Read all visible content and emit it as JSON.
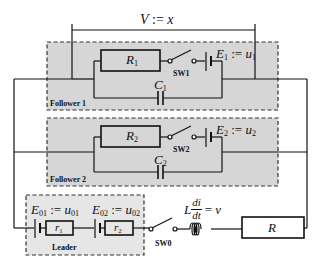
{
  "diagram": {
    "title_measure": {
      "label": "V := x",
      "lhs": "V",
      "op": ":=",
      "rhs": "x"
    },
    "groups": [
      {
        "name": "Follower 1",
        "components": {
          "resistor": {
            "symbol": "R",
            "sub": "1"
          },
          "switch": {
            "label": "SW1"
          },
          "source": {
            "symbol": "E",
            "sub": "1",
            "op": ":=",
            "rhs": "u",
            "rhs_sub": "1"
          },
          "capacitor": {
            "symbol": "C",
            "sub": "1"
          }
        }
      },
      {
        "name": "Follower 2",
        "components": {
          "resistor": {
            "symbol": "R",
            "sub": "2"
          },
          "switch": {
            "label": "SW2"
          },
          "source": {
            "symbol": "E",
            "sub": "2",
            "op": ":=",
            "rhs": "u",
            "rhs_sub": "2"
          },
          "capacitor": {
            "symbol": "C",
            "sub": "2"
          }
        }
      },
      {
        "name": "Leader",
        "components": {
          "source1": {
            "symbol": "E",
            "sub": "01",
            "op": ":=",
            "rhs": "u",
            "rhs_sub": "01"
          },
          "resistor1": {
            "symbol": "r",
            "sub": "1"
          },
          "source2": {
            "symbol": "E",
            "sub": "02",
            "op": ":=",
            "rhs": "u",
            "rhs_sub": "02"
          },
          "resistor2": {
            "symbol": "r",
            "sub": "2"
          }
        }
      }
    ],
    "main_switch": {
      "label": "SW0"
    },
    "inductor": {
      "prefix": "L",
      "num": "di",
      "den": "dt",
      "eq": "=",
      "rhs": "v"
    },
    "load": {
      "symbol": "R"
    },
    "colors": {
      "wire": "#111111",
      "group_fill": "#d6d6d6",
      "leader_fill": "#e6e6e6",
      "dash": "#333333"
    }
  }
}
